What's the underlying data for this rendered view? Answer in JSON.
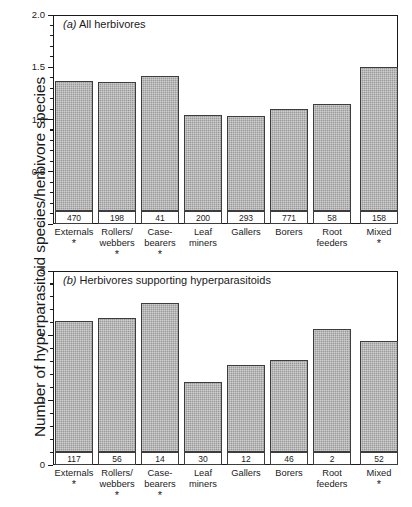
{
  "figure": {
    "ylabel": "Number of hyperparasitoid species/herbivore species",
    "background": "#ffffff",
    "bar_fill": "#9a9a9a",
    "bar_edge": "#3d3d3d",
    "axis_color": "#1a1a1a"
  },
  "chart_data": [
    {
      "type": "bar",
      "panel": "a",
      "panel_letter": "(a)",
      "title": "All herbivores",
      "title_full": "(a) All herbivores",
      "categories": [
        "Externals",
        "Rollers/\nwebbers",
        "Case-\nbearers",
        "Leaf\nminers",
        "Gallers",
        "Borers",
        "Root\nfeeders",
        "Mixed"
      ],
      "values": [
        1.37,
        1.36,
        1.42,
        1.04,
        1.03,
        1.1,
        1.15,
        1.5
      ],
      "n_labels": [
        "470",
        "198",
        "41",
        "200",
        "293",
        "771",
        "58",
        "158"
      ],
      "significance": [
        "*",
        "*",
        "*",
        "",
        "",
        "",
        "",
        "*"
      ],
      "xlabel": "",
      "ylabel": "Number of hyperparasitoid species/herbivore species",
      "ylim": [
        0,
        2.0
      ],
      "yticks": [
        0,
        0.5,
        1.0,
        1.5,
        2.0
      ],
      "ytick_labels": [
        "0",
        "0.5",
        "1.0",
        "1.5",
        "2.0"
      ],
      "yminor_step": 0.1,
      "grid": false,
      "legend": "none"
    },
    {
      "type": "bar",
      "panel": "b",
      "panel_letter": "(b)",
      "title": "Herbivores supporting hyperparasitoids",
      "title_full": "(b) Herbivores supporting hyperparasitoids",
      "categories": [
        "Externals",
        "Rollers/\nwebbers",
        "Case-\nbearers",
        "Leaf\nminers",
        "Gallers",
        "Borers",
        "Root\nfeeders",
        "Mixed"
      ],
      "values": [
        2.22,
        2.27,
        2.5,
        1.28,
        1.55,
        1.62,
        2.11,
        1.92
      ],
      "n_labels": [
        "117",
        "56",
        "14",
        "30",
        "12",
        "46",
        "2",
        "52"
      ],
      "significance": [
        "*",
        "*",
        "*",
        "",
        "",
        "",
        "",
        "*"
      ],
      "xlabel": "",
      "ylabel": "Number of hyperparasitoid species/herbivore species",
      "ylim": [
        0,
        3
      ],
      "yticks": [
        0,
        1,
        2,
        3
      ],
      "ytick_labels": [
        "0",
        "1",
        "2",
        "3"
      ],
      "yminor_step": 0.2,
      "grid": false,
      "legend": "none"
    }
  ]
}
